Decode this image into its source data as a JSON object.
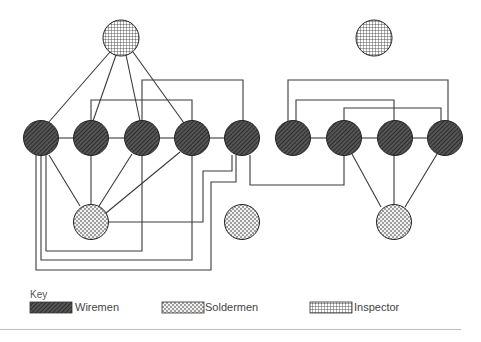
{
  "diagram": {
    "node_types": {
      "wireman": {
        "pattern": "diagonal-hatch",
        "fill": "#3a3a3a"
      },
      "solderman": {
        "pattern": "dotted-stipple",
        "fill": "#e8e8e8"
      },
      "inspector": {
        "pattern": "cross-grid",
        "fill": "#f4f4f4"
      }
    },
    "nodes": [
      {
        "id": "I1",
        "type": "inspector"
      },
      {
        "id": "I3",
        "type": "inspector"
      },
      {
        "id": "W1",
        "type": "wireman"
      },
      {
        "id": "W2",
        "type": "wireman"
      },
      {
        "id": "W3",
        "type": "wireman"
      },
      {
        "id": "W4",
        "type": "wireman"
      },
      {
        "id": "W5",
        "type": "wireman"
      },
      {
        "id": "W6",
        "type": "wireman"
      },
      {
        "id": "W7",
        "type": "wireman"
      },
      {
        "id": "W8",
        "type": "wireman"
      },
      {
        "id": "W9",
        "type": "wireman"
      },
      {
        "id": "S1",
        "type": "solderman"
      },
      {
        "id": "S2",
        "type": "solderman"
      },
      {
        "id": "S4",
        "type": "solderman"
      }
    ],
    "edges": [
      [
        "I1",
        "W1"
      ],
      [
        "I1",
        "W2"
      ],
      [
        "I1",
        "W3"
      ],
      [
        "I1",
        "W4"
      ],
      [
        "W1",
        "W2"
      ],
      [
        "W2",
        "W3"
      ],
      [
        "W3",
        "W4"
      ],
      [
        "W4",
        "W5"
      ],
      [
        "W6",
        "W7"
      ],
      [
        "W7",
        "W8"
      ],
      [
        "W8",
        "W9"
      ],
      [
        "W1",
        "S1"
      ],
      [
        "W2",
        "S1"
      ],
      [
        "W3",
        "S1"
      ],
      [
        "W4",
        "S1"
      ],
      [
        "W2",
        "W4"
      ],
      [
        "W3",
        "W5"
      ],
      [
        "W6",
        "W9"
      ],
      [
        "W6",
        "W8"
      ],
      [
        "W7",
        "W9"
      ],
      [
        "W7",
        "S4"
      ],
      [
        "W8",
        "S4"
      ],
      [
        "W9",
        "S4"
      ],
      [
        "W1",
        "W3"
      ],
      [
        "W1",
        "W4"
      ],
      [
        "W1",
        "W5"
      ],
      [
        "S1",
        "W5"
      ],
      [
        "W5",
        "W7"
      ]
    ]
  },
  "key": {
    "title": "Key",
    "items": [
      {
        "label": "Wiremen",
        "type": "wireman"
      },
      {
        "label": "Soldermen",
        "type": "solderman"
      },
      {
        "label": "Inspector",
        "type": "inspector"
      }
    ]
  }
}
